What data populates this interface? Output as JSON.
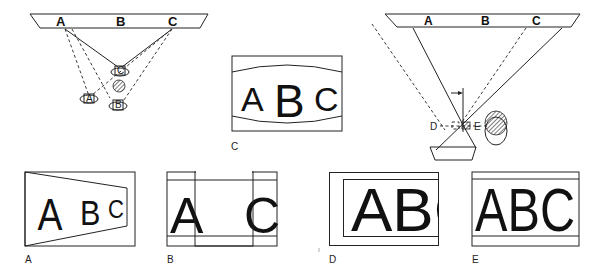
{
  "figure": {
    "screen_letters": [
      "A",
      "B",
      "C"
    ],
    "top_left": {
      "title": "Three-projector setup",
      "projectors": [
        "A",
        "B",
        "C"
      ],
      "obstruction": "hatched column"
    },
    "top_center": {
      "panel_label": "C",
      "letters": [
        "A",
        "B",
        "C"
      ]
    },
    "top_right": {
      "title": "Single projector with lateral offset",
      "positions": [
        "D",
        "E"
      ]
    },
    "bottom_panels": [
      {
        "label": "A",
        "letters": [
          "A",
          "B",
          "C"
        ],
        "note": "keystone distortion"
      },
      {
        "label": "B",
        "letters": [
          "A",
          "",
          "C"
        ],
        "note": "center blocked"
      },
      {
        "label": "D",
        "letters": [
          "A",
          "B",
          "C"
        ],
        "note": "shifted right, cropped"
      },
      {
        "label": "E",
        "letters": [
          "A",
          "B",
          "C"
        ],
        "note": "correct framing"
      }
    ]
  },
  "colors": {
    "ink": "#1a1a1a",
    "background": "#ffffff"
  }
}
